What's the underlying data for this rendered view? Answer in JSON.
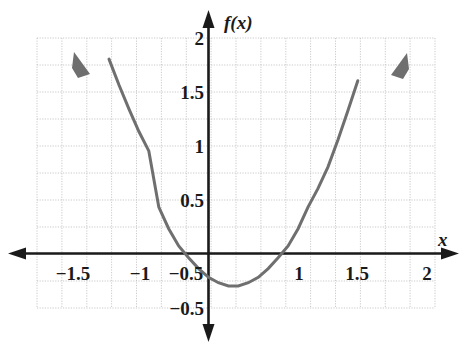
{
  "chart_data": {
    "type": "line",
    "title": "",
    "xlabel": "x",
    "ylabel": "f(x)",
    "xlim": [
      -1.75,
      2.12
    ],
    "ylim": [
      -0.62,
      2.12
    ],
    "grid": true,
    "grid_step": 0.25,
    "legend": "none",
    "x_tick_labels": [
      "−1.5",
      "−1",
      "−0.5",
      "1",
      "1.5",
      "2"
    ],
    "x_tick_values": [
      -1.5,
      -1,
      -0.5,
      1,
      1.5,
      2
    ],
    "y_tick_labels": [
      "2",
      "1.5",
      "1",
      "0.5",
      "−0.5"
    ],
    "y_tick_values": [
      2,
      1.5,
      1,
      0.5,
      -0.5
    ],
    "series": [
      {
        "name": "f(x)",
        "kind": "parabola",
        "color": "#6b6b6b",
        "vertex": [
          0.25,
          -0.3
        ],
        "leading_coefficient": 1.3,
        "roots": [
          -0.23,
          0.73
        ],
        "arrow_start": true,
        "arrow_end": true,
        "x": [
          -1.3,
          -1.2,
          -1.1,
          -1.0,
          -0.9,
          -0.8,
          -0.7,
          -0.6,
          -0.5,
          -0.4,
          -0.3,
          -0.2,
          -0.1,
          0.0,
          0.1,
          0.2,
          0.25,
          0.3,
          0.4,
          0.5,
          0.6,
          0.7,
          0.8,
          0.9,
          1.0,
          1.1,
          1.2,
          1.3,
          1.4,
          1.5,
          1.6,
          1.7,
          1.8
        ],
        "y": [
          2.63,
          2.33,
          2.05,
          1.8,
          1.56,
          1.34,
          1.13,
          0.95,
          0.43,
          0.23,
          0.07,
          -0.04,
          -0.14,
          -0.22,
          -0.27,
          -0.3,
          -0.3,
          -0.3,
          -0.27,
          -0.22,
          -0.14,
          -0.04,
          0.07,
          0.23,
          0.43,
          0.6,
          0.8,
          1.05,
          1.32,
          1.6,
          1.92,
          2.25,
          2.6
        ]
      }
    ]
  },
  "axes": {
    "x_axis_label": "x",
    "y_axis_label": "f(x)",
    "x_arrow_left": true,
    "x_arrow_right": true,
    "y_arrow_up": true,
    "y_arrow_down": true
  },
  "colors": {
    "curve": "#6b6b6b",
    "axis": "#1a1a1a",
    "grid": "#b9b9b9",
    "text": "#1a1a1a",
    "background": "#ffffff"
  },
  "ticks": {
    "x": [
      {
        "label": "−1.5",
        "left": 73,
        "top": 264
      },
      {
        "label": "−1",
        "left": 140,
        "top": 264
      },
      {
        "label": "−0.5",
        "left": 161,
        "top": 264
      },
      {
        "label": "1",
        "left": 299,
        "top": 264
      },
      {
        "label": "1.5",
        "left": 352,
        "top": 264
      },
      {
        "label": "2",
        "left": 424,
        "top": 264
      }
    ],
    "y": [
      {
        "label": "2",
        "left": 203,
        "top": 38
      },
      {
        "label": "1.5",
        "left": 203,
        "top": 83
      },
      {
        "label": "1",
        "left": 203,
        "top": 142
      },
      {
        "label": "0.5",
        "left": 203,
        "top": 200
      },
      {
        "label": "−0.5",
        "left": 203,
        "top": 309
      }
    ]
  },
  "labels": {
    "y_axis_name": {
      "text": "f(x)",
      "left": 224,
      "top": 13
    },
    "x_axis_name": {
      "text": "x",
      "left": 440,
      "top": 232
    }
  }
}
